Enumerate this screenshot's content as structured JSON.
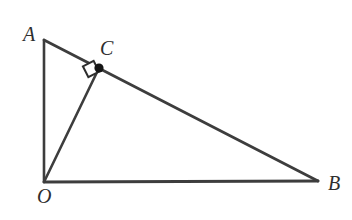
{
  "figure": {
    "canvas": {
      "width": 352,
      "height": 220,
      "background": "#ffffff"
    },
    "style": {
      "stroke_color": "#3d3d3d",
      "stroke_width": 2.6,
      "label_color": "#2e2e2e",
      "point_fill": "#151515"
    },
    "points": {
      "A": {
        "label": "A",
        "x": 44,
        "y": 40,
        "label_x": 31,
        "label_y": 34
      },
      "O": {
        "label": "O",
        "x": 44,
        "y": 182,
        "label_x": 44,
        "label_y": 196
      },
      "B": {
        "label": "B",
        "x": 318,
        "y": 181,
        "label_x": 335,
        "label_y": 183
      },
      "C": {
        "label": "C",
        "x": 99,
        "y": 68,
        "label_x": 108,
        "label_y": 48
      }
    },
    "segments": [
      {
        "name": "segment-AO",
        "from": "A",
        "to": "O"
      },
      {
        "name": "segment-OB",
        "from": "O",
        "to": "B"
      },
      {
        "name": "segment-AB",
        "from": "A",
        "to": "B"
      },
      {
        "name": "segment-OC",
        "from": "O",
        "to": "C"
      }
    ],
    "markers": {
      "right_angle_at_C": {
        "name": "right-angle-marker",
        "center_x": 91,
        "center_y": 69,
        "size": 12,
        "rotation_deg": -27,
        "description": "open square indicating OC is perpendicular to AB at C"
      },
      "point_C_dot": {
        "name": "point-c-dot",
        "x": 99,
        "y": 68,
        "radius": 4.6
      }
    }
  }
}
